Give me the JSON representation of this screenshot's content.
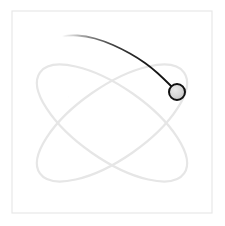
{
  "scene": {
    "title": "Orbit Trail Simulation",
    "background_color": "#ffffff",
    "width": 225,
    "height": 226
  },
  "frame": {
    "name": "plot-border",
    "x": 12,
    "y": 11,
    "width": 200,
    "height": 202,
    "stroke_color": "#e8e8e8",
    "stroke_width": 1.2,
    "fill": "none"
  },
  "chart_data": {
    "type": "line",
    "title": "Orbit Trail Simulation",
    "xlabel": "",
    "ylabel": "",
    "grid": false,
    "legend": false,
    "xlim": [
      12,
      212
    ],
    "ylim": [
      11,
      213
    ],
    "series": [
      {
        "name": "ghost-orbit-a",
        "role": "faint reference ellipse tilted clockwise",
        "color": "#e6e6e6",
        "stroke_width": 2.2,
        "center": [
          112,
          123
        ],
        "rx": 88,
        "ry": 36,
        "rotation_deg": -35
      },
      {
        "name": "ghost-orbit-b",
        "role": "faint reference ellipse tilted counter-clockwise",
        "color": "#e6e6e6",
        "stroke_width": 2.2,
        "center": [
          112,
          123
        ],
        "rx": 88,
        "ry": 36,
        "rotation_deg": 35
      },
      {
        "name": "motion-trail",
        "role": "dark fading trail of the moving body",
        "color_head": "#1a1a1a",
        "color_tail": "#ffffff",
        "stroke_width": 1.8,
        "fades": true,
        "points": [
          [
            68,
            97
          ],
          [
            56,
            83
          ],
          [
            47,
            68
          ],
          [
            43,
            55
          ],
          [
            46,
            45
          ],
          [
            55,
            38
          ],
          [
            69,
            35
          ],
          [
            86,
            36
          ],
          [
            104,
            41
          ],
          [
            122,
            49
          ],
          [
            138,
            58
          ],
          [
            152,
            68
          ],
          [
            164,
            79
          ],
          [
            172,
            87
          ]
        ]
      }
    ],
    "markers": [
      {
        "name": "orbiting-body",
        "cx": 177,
        "cy": 92,
        "r": 8,
        "fill_color": "#d4d4d4",
        "stroke_color": "#111111",
        "stroke_width": 2
      }
    ]
  }
}
